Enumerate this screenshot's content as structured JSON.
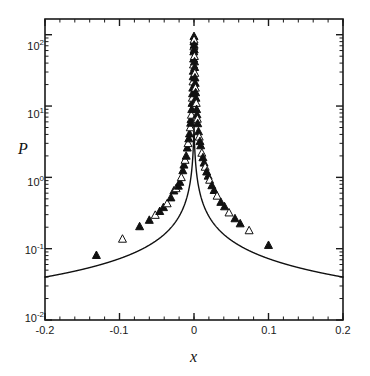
{
  "figure": {
    "background_color": "#ffffff",
    "frame_color": "#1a1a1a",
    "curve_color": "#111111",
    "marker_color": "#111111"
  },
  "axes": {
    "x_title": "x",
    "y_title": "P",
    "x_tick_labels": [
      "-0.2",
      "-0.1",
      "0",
      "0.1",
      "0.2"
    ],
    "y_tick_mantissas": [
      "10",
      "10",
      "10",
      "10",
      "10"
    ],
    "y_tick_exponents": [
      "2",
      "1",
      "0",
      "-1",
      "-2"
    ]
  },
  "chart_data": {
    "type": "scatter",
    "title": "",
    "xlabel": "x",
    "ylabel": "P",
    "xlim": [
      -0.2,
      0.2
    ],
    "ylim": [
      0.01,
      215.0
    ],
    "yscale": "log",
    "xscale": "linear",
    "grid": false,
    "legend": null,
    "x_ticks": [
      -0.2,
      -0.1,
      0,
      0.1,
      0.2
    ],
    "y_ticks": [
      0.01,
      0.1,
      1,
      10,
      100
    ],
    "y_minor_ticks": true,
    "series": [
      {
        "name": "fit-curve",
        "type": "line",
        "style": "solid",
        "linewidth": 1.3,
        "x": [
          -0.2,
          -0.19,
          -0.18,
          -0.17,
          -0.16,
          -0.15,
          -0.14,
          -0.13,
          -0.12,
          -0.11,
          -0.1,
          -0.095,
          -0.09,
          -0.085,
          -0.08,
          -0.075,
          -0.07,
          -0.065,
          -0.06,
          -0.055,
          -0.05,
          -0.045,
          -0.04,
          -0.035,
          -0.03,
          -0.027,
          -0.024,
          -0.021,
          -0.018,
          -0.015,
          -0.013,
          -0.011,
          -0.009,
          -0.0075,
          -0.006,
          -0.005,
          -0.004,
          -0.003,
          -0.002,
          -0.0015,
          -0.001,
          -0.0006,
          -0.0003,
          0.0,
          0.0003,
          0.0006,
          0.001,
          0.0015,
          0.002,
          0.003,
          0.004,
          0.005,
          0.006,
          0.0075,
          0.009,
          0.011,
          0.013,
          0.015,
          0.018,
          0.021,
          0.024,
          0.027,
          0.03,
          0.035,
          0.04,
          0.045,
          0.05,
          0.055,
          0.06,
          0.065,
          0.07,
          0.075,
          0.08,
          0.085,
          0.09,
          0.095,
          0.1,
          0.11,
          0.12,
          0.13,
          0.14,
          0.15,
          0.16,
          0.17,
          0.18,
          0.19,
          0.2
        ],
        "y": [
          0.04,
          0.0428,
          0.046,
          0.0496,
          0.0537,
          0.0584,
          0.0638,
          0.0702,
          0.0777,
          0.0867,
          0.0977,
          0.1041,
          0.1113,
          0.1194,
          0.1285,
          0.1389,
          0.1509,
          0.1647,
          0.1808,
          0.1998,
          0.2223,
          0.2494,
          0.2826,
          0.3239,
          0.3765,
          0.4157,
          0.4628,
          0.52,
          0.5908,
          0.6801,
          0.752,
          0.8393,
          0.947,
          1.042,
          1.169,
          1.271,
          1.396,
          1.555,
          1.765,
          1.9,
          2.064,
          2.23,
          2.38,
          2.5,
          2.38,
          2.23,
          2.064,
          1.9,
          1.765,
          1.555,
          1.396,
          1.271,
          1.169,
          1.042,
          0.947,
          0.8393,
          0.752,
          0.6801,
          0.5908,
          0.52,
          0.4628,
          0.4157,
          0.3765,
          0.3239,
          0.2826,
          0.2494,
          0.2223,
          0.1998,
          0.1808,
          0.1647,
          0.1509,
          0.1389,
          0.1285,
          0.1194,
          0.1113,
          0.1041,
          0.0977,
          0.0867,
          0.0777,
          0.0702,
          0.0638,
          0.0584,
          0.0537,
          0.0496,
          0.046,
          0.0428,
          0.04
        ],
        "note": "central cusp rises sharply to about 130 at x=0"
      },
      {
        "name": "measured-data",
        "type": "scatter",
        "marker": "triangle",
        "marker_fill": "mixed-filled-and-open",
        "x": [
          -0.131,
          -0.096,
          -0.073,
          -0.06,
          -0.052,
          -0.046,
          -0.041,
          -0.036,
          -0.031,
          -0.027,
          -0.024,
          -0.021,
          -0.019,
          -0.017,
          -0.015,
          -0.0135,
          -0.012,
          -0.0105,
          -0.009,
          -0.008,
          -0.007,
          -0.006,
          -0.005,
          -0.0045,
          -0.004,
          -0.0035,
          -0.003,
          -0.0026,
          -0.0022,
          -0.0019,
          -0.0016,
          -0.0013,
          -0.0011,
          -0.0009,
          -0.0007,
          -0.0005,
          -0.0003,
          -0.0002,
          -0.0001,
          0.0,
          0.0001,
          0.0002,
          0.0003,
          0.0005,
          0.0007,
          0.0009,
          0.0011,
          0.0013,
          0.0016,
          0.0019,
          0.0022,
          0.0026,
          0.003,
          0.0035,
          0.004,
          0.0045,
          0.005,
          0.006,
          0.007,
          0.008,
          0.009,
          0.0105,
          0.012,
          0.0135,
          0.015,
          0.017,
          0.019,
          0.021,
          0.024,
          0.027,
          0.031,
          0.036,
          0.041,
          0.047,
          0.055,
          0.062,
          0.074,
          0.1
        ],
        "y": [
          0.081,
          0.137,
          0.205,
          0.252,
          0.296,
          0.335,
          0.38,
          0.43,
          0.52,
          0.65,
          0.7,
          0.76,
          0.86,
          1.0,
          1.25,
          1.5,
          1.75,
          2.0,
          2.6,
          3.0,
          3.5,
          4.1,
          5.0,
          5.8,
          6.5,
          7.5,
          9.0,
          11.0,
          13.0,
          15.0,
          18.0,
          22.0,
          26.0,
          31.0,
          38.0,
          46.0,
          58.0,
          68.0,
          80.0,
          95.0,
          85.0,
          72.0,
          62.0,
          50.0,
          42.0,
          35.0,
          29.0,
          25.0,
          21.0,
          18.0,
          15.5,
          13.0,
          11.0,
          9.0,
          7.6,
          6.6,
          5.7,
          4.4,
          3.7,
          3.2,
          2.8,
          2.2,
          1.9,
          1.6,
          1.4,
          1.2,
          1.05,
          0.92,
          0.77,
          0.66,
          0.55,
          0.45,
          0.39,
          0.32,
          0.265,
          0.225,
          0.18,
          0.112
        ]
      }
    ]
  }
}
